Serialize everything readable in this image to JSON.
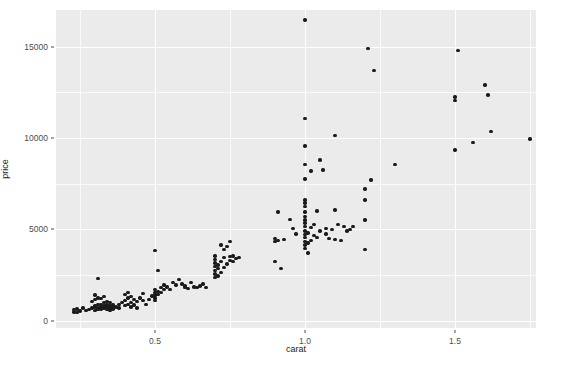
{
  "chart_data": {
    "type": "scatter",
    "title": "",
    "xlabel": "carat",
    "ylabel": "price",
    "xlim": [
      0.17,
      1.77
    ],
    "ylim": [
      -400,
      17000
    ],
    "xticks": [
      "0.5",
      "1.0",
      "1.5"
    ],
    "xtick_values": [
      0.5,
      1.0,
      1.5
    ],
    "yticks": [
      "0",
      "5000",
      "10000",
      "15000"
    ],
    "ytick_values": [
      0,
      5000,
      10000,
      15000
    ],
    "grid": true,
    "legend": "none",
    "point_color": "#1a1a1a",
    "panel_color": "#ebebeb",
    "gridline_color": "#ffffff",
    "n_points": 180,
    "points": [
      [
        0.23,
        620
      ],
      [
        0.24,
        650
      ],
      [
        0.23,
        480
      ],
      [
        0.25,
        540
      ],
      [
        0.26,
        700
      ],
      [
        0.24,
        460
      ],
      [
        0.27,
        560
      ],
      [
        0.28,
        620
      ],
      [
        0.29,
        700
      ],
      [
        0.3,
        760
      ],
      [
        0.3,
        560
      ],
      [
        0.3,
        820
      ],
      [
        0.31,
        700
      ],
      [
        0.31,
        880
      ],
      [
        0.31,
        620
      ],
      [
        0.32,
        760
      ],
      [
        0.32,
        900
      ],
      [
        0.32,
        640
      ],
      [
        0.33,
        820
      ],
      [
        0.33,
        980
      ],
      [
        0.33,
        700
      ],
      [
        0.34,
        760
      ],
      [
        0.34,
        900
      ],
      [
        0.34,
        1050
      ],
      [
        0.35,
        820
      ],
      [
        0.35,
        700
      ],
      [
        0.35,
        980
      ],
      [
        0.36,
        880
      ],
      [
        0.36,
        760
      ],
      [
        0.3,
        1400
      ],
      [
        0.31,
        1250
      ],
      [
        0.3,
        1150
      ],
      [
        0.29,
        1050
      ],
      [
        0.32,
        1200
      ],
      [
        0.33,
        1320
      ],
      [
        0.31,
        2300
      ],
      [
        0.34,
        620
      ],
      [
        0.35,
        560
      ],
      [
        0.36,
        640
      ],
      [
        0.37,
        760
      ],
      [
        0.38,
        880
      ],
      [
        0.38,
        700
      ],
      [
        0.39,
        980
      ],
      [
        0.4,
        820
      ],
      [
        0.4,
        1100
      ],
      [
        0.41,
        900
      ],
      [
        0.41,
        1250
      ],
      [
        0.42,
        1000
      ],
      [
        0.42,
        760
      ],
      [
        0.43,
        1150
      ],
      [
        0.4,
        1450
      ],
      [
        0.41,
        1550
      ],
      [
        0.42,
        1320
      ],
      [
        0.43,
        860
      ],
      [
        0.44,
        1050
      ],
      [
        0.44,
        700
      ],
      [
        0.45,
        1250
      ],
      [
        0.46,
        1500
      ],
      [
        0.46,
        1100
      ],
      [
        0.47,
        900
      ],
      [
        0.48,
        1150
      ],
      [
        0.49,
        1350
      ],
      [
        0.5,
        1550
      ],
      [
        0.5,
        1400
      ],
      [
        0.5,
        1250
      ],
      [
        0.5,
        1700
      ],
      [
        0.5,
        1100
      ],
      [
        0.51,
        1600
      ],
      [
        0.51,
        1450
      ],
      [
        0.52,
        1800
      ],
      [
        0.52,
        1550
      ],
      [
        0.53,
        1700
      ],
      [
        0.5,
        3850
      ],
      [
        0.51,
        2750
      ],
      [
        0.53,
        1950
      ],
      [
        0.54,
        1850
      ],
      [
        0.55,
        1700
      ],
      [
        0.56,
        2100
      ],
      [
        0.57,
        1950
      ],
      [
        0.58,
        2250
      ],
      [
        0.59,
        2000
      ],
      [
        0.6,
        1800
      ],
      [
        0.6,
        1900
      ],
      [
        0.61,
        1750
      ],
      [
        0.62,
        2100
      ],
      [
        0.63,
        1850
      ],
      [
        0.64,
        1800
      ],
      [
        0.65,
        1900
      ],
      [
        0.66,
        2000
      ],
      [
        0.67,
        1800
      ],
      [
        0.7,
        2350
      ],
      [
        0.7,
        2550
      ],
      [
        0.7,
        2750
      ],
      [
        0.7,
        2950
      ],
      [
        0.7,
        3150
      ],
      [
        0.7,
        3350
      ],
      [
        0.7,
        3550
      ],
      [
        0.71,
        2450
      ],
      [
        0.71,
        2850
      ],
      [
        0.71,
        3050
      ],
      [
        0.72,
        2650
      ],
      [
        0.72,
        3250
      ],
      [
        0.73,
        2900
      ],
      [
        0.73,
        3450
      ],
      [
        0.74,
        3100
      ],
      [
        0.74,
        4050
      ],
      [
        0.75,
        3300
      ],
      [
        0.75,
        3500
      ],
      [
        0.76,
        3250
      ],
      [
        0.76,
        3550
      ],
      [
        0.77,
        3400
      ],
      [
        0.78,
        3450
      ],
      [
        0.75,
        4350
      ],
      [
        0.73,
        3900
      ],
      [
        0.72,
        4150
      ],
      [
        0.9,
        3250
      ],
      [
        0.9,
        4350
      ],
      [
        0.9,
        4500
      ],
      [
        0.91,
        4400
      ],
      [
        0.91,
        5950
      ],
      [
        0.92,
        2850
      ],
      [
        0.93,
        4450
      ],
      [
        0.95,
        5550
      ],
      [
        0.96,
        5050
      ],
      [
        0.97,
        4750
      ],
      [
        1.0,
        3950
      ],
      [
        1.0,
        4150
      ],
      [
        1.0,
        4350
      ],
      [
        1.0,
        4550
      ],
      [
        1.0,
        4700
      ],
      [
        1.0,
        4900
      ],
      [
        1.0,
        5150
      ],
      [
        1.0,
        5350
      ],
      [
        1.0,
        5500
      ],
      [
        1.0,
        5700
      ],
      [
        1.0,
        5950
      ],
      [
        1.0,
        6250
      ],
      [
        1.0,
        6450
      ],
      [
        1.0,
        6600
      ],
      [
        1.0,
        7750
      ],
      [
        1.0,
        8550
      ],
      [
        1.0,
        9550
      ],
      [
        1.0,
        11050
      ],
      [
        1.0,
        16450
      ],
      [
        1.01,
        3700
      ],
      [
        1.01,
        4250
      ],
      [
        1.01,
        4800
      ],
      [
        1.02,
        4400
      ],
      [
        1.02,
        5100
      ],
      [
        1.02,
        8200
      ],
      [
        1.03,
        4650
      ],
      [
        1.03,
        5250
      ],
      [
        1.04,
        4550
      ],
      [
        1.04,
        6000
      ],
      [
        1.05,
        4900
      ],
      [
        1.05,
        8800
      ],
      [
        1.06,
        8250
      ],
      [
        1.07,
        4750
      ],
      [
        1.07,
        5050
      ],
      [
        1.08,
        4500
      ],
      [
        1.09,
        5000
      ],
      [
        1.1,
        4450
      ],
      [
        1.1,
        6050
      ],
      [
        1.1,
        10150
      ],
      [
        1.11,
        5250
      ],
      [
        1.12,
        4400
      ],
      [
        1.13,
        5150
      ],
      [
        1.14,
        4900
      ],
      [
        1.15,
        5000
      ],
      [
        1.16,
        5150
      ],
      [
        1.2,
        3900
      ],
      [
        1.2,
        5500
      ],
      [
        1.2,
        6600
      ],
      [
        1.2,
        7200
      ],
      [
        1.21,
        14900
      ],
      [
        1.22,
        7700
      ],
      [
        1.23,
        13700
      ],
      [
        1.3,
        8550
      ],
      [
        1.5,
        9350
      ],
      [
        1.5,
        12050
      ],
      [
        1.5,
        12250
      ],
      [
        1.51,
        14800
      ],
      [
        1.56,
        9750
      ],
      [
        1.6,
        12900
      ],
      [
        1.61,
        12350
      ],
      [
        1.62,
        10350
      ],
      [
        1.75,
        9950
      ]
    ]
  },
  "ghost_artifacts": [
    {
      "text": "the supple PDF code with conditional mass processing. The chart",
      "x": 64,
      "y": 38
    },
    {
      "text": "Colour chart",
      "x": 412,
      "y": 62
    }
  ]
}
